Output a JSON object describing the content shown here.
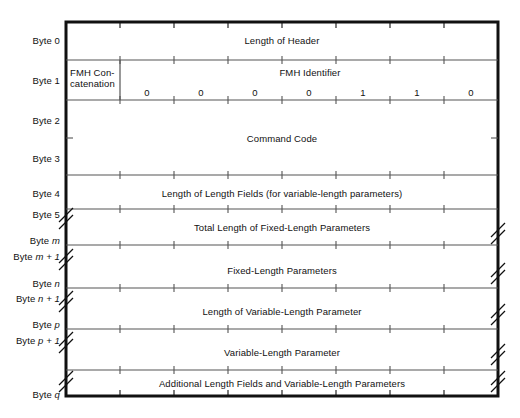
{
  "diagram": {
    "geometry": {
      "left": 66,
      "right": 498,
      "top": 22,
      "bottom": 396,
      "bit_columns": 8
    },
    "colors": {
      "outer_border": "#111111",
      "inner_rule": "#555555",
      "text": "#111111",
      "background": "#ffffff"
    },
    "byte_labels": [
      {
        "text": "Byte 0",
        "italic_part": "",
        "y": 40
      },
      {
        "text": "Byte 1",
        "italic_part": "",
        "y": 80
      },
      {
        "text": "Byte 2",
        "italic_part": "",
        "y": 120
      },
      {
        "text": "Byte 3",
        "italic_part": "",
        "y": 158
      },
      {
        "text": "Byte 4",
        "italic_part": "",
        "y": 193
      },
      {
        "text": "Byte 5",
        "italic_part": "",
        "y": 214
      },
      {
        "text": "Byte ",
        "italic_part": "m",
        "y": 240
      },
      {
        "text": "Byte ",
        "italic_part": "m + 1",
        "y": 256
      },
      {
        "text": "Byte ",
        "italic_part": "n",
        "y": 283
      },
      {
        "text": "Byte ",
        "italic_part": "n + 1",
        "y": 298
      },
      {
        "text": "Byte ",
        "italic_part": "p",
        "y": 324
      },
      {
        "text": "Byte ",
        "italic_part": "p + 1",
        "y": 340
      },
      {
        "text": "Byte ",
        "italic_part": "q",
        "y": 394
      }
    ],
    "fields": [
      {
        "name": "length-of-header",
        "label": "Length of Header",
        "y": 40,
        "x": 282
      },
      {
        "name": "fmh-concatenation",
        "label": "FMH Con-\ncatenation",
        "y": 78,
        "x": 70
      },
      {
        "name": "fmh-identifier",
        "label": "FMH Identifier",
        "y": 72,
        "x": 310
      },
      {
        "name": "command-code",
        "label": "Command Code",
        "y": 138,
        "x": 282
      },
      {
        "name": "length-of-length-fields",
        "label": "Length of Length Fields (for variable-length parameters)",
        "y": 193,
        "x": 282
      },
      {
        "name": "total-length-fixed-params",
        "label": "Total Length of Fixed-Length Parameters",
        "y": 227,
        "x": 282
      },
      {
        "name": "fixed-length-parameters",
        "label": "Fixed-Length Parameters",
        "y": 270,
        "x": 282
      },
      {
        "name": "length-of-variable-param",
        "label": "Length of Variable-Length Parameter",
        "y": 311,
        "x": 282
      },
      {
        "name": "variable-length-parameter",
        "label": "Variable-Length Parameter",
        "y": 352,
        "x": 282
      },
      {
        "name": "additional-length-fields",
        "label": "Additional Length Fields and Variable-Length Parameters",
        "y": 383,
        "x": 282
      }
    ],
    "fmh_identifier_bits": [
      {
        "bit": 1,
        "value": "0",
        "x": 147
      },
      {
        "bit": 2,
        "value": "0",
        "x": 201
      },
      {
        "bit": 3,
        "value": "0",
        "x": 255
      },
      {
        "bit": 4,
        "value": "0",
        "x": 309
      },
      {
        "bit": 5,
        "value": "1",
        "x": 363
      },
      {
        "bit": 6,
        "value": "1",
        "x": 417
      },
      {
        "bit": 7,
        "value": "0",
        "x": 471
      }
    ],
    "bit_label_y": 92,
    "row_rules": [
      {
        "name": "rule-byte0-byte1",
        "y": 60,
        "full_ticks": true
      },
      {
        "name": "rule-byte1-byte2",
        "y": 100,
        "full_ticks": true
      },
      {
        "name": "rule-byte3-byte4",
        "y": 175,
        "full_ticks": true
      },
      {
        "name": "rule-byte4-byte5",
        "y": 209,
        "full_ticks": true
      },
      {
        "name": "rule-byte-m",
        "y": 245,
        "full_ticks": true
      },
      {
        "name": "rule-byte-n",
        "y": 288,
        "full_ticks": true
      },
      {
        "name": "rule-byte-p",
        "y": 329,
        "full_ticks": true
      },
      {
        "name": "rule-lower",
        "y": 370,
        "full_ticks": true
      }
    ],
    "break_marks": [
      {
        "name": "break-left-byte5",
        "side": "left",
        "y": 222
      },
      {
        "name": "break-left-m1",
        "side": "left",
        "y": 263
      },
      {
        "name": "break-left-n1",
        "side": "left",
        "y": 305
      },
      {
        "name": "break-left-p1",
        "side": "left",
        "y": 346
      },
      {
        "name": "break-left-q",
        "side": "left",
        "y": 385
      },
      {
        "name": "break-right-byte5",
        "side": "right",
        "y": 237
      },
      {
        "name": "break-right-m1",
        "side": "right",
        "y": 277
      },
      {
        "name": "break-right-n1",
        "side": "right",
        "y": 318
      },
      {
        "name": "break-right-p1",
        "side": "right",
        "y": 358
      },
      {
        "name": "break-right-q",
        "side": "right",
        "y": 385
      }
    ]
  }
}
